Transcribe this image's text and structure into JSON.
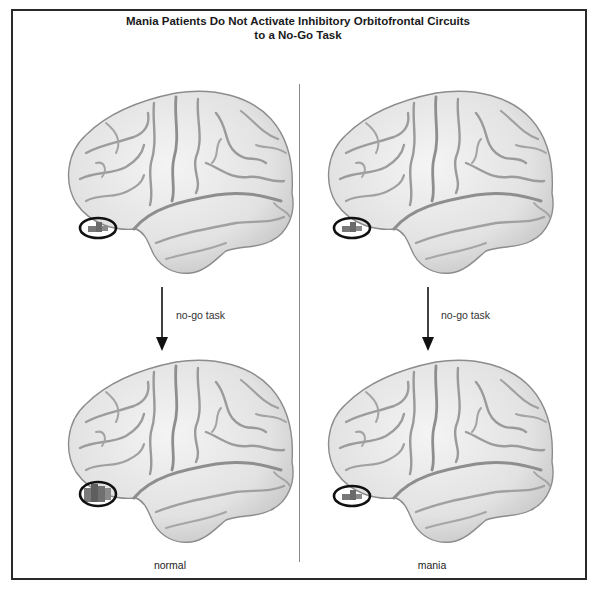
{
  "figure": {
    "title_line1": "Mania Patients Do Not Activate Inhibitory Orbitofrontal Circuits",
    "title_line2": "to a No-Go Task"
  },
  "panels": [
    {
      "id": "normal",
      "label": "normal",
      "arrow_label": "no-go task",
      "before": {
        "activation": "small",
        "highlight": "orbitofrontal"
      },
      "after": {
        "activation": "large",
        "highlight": "orbitofrontal"
      }
    },
    {
      "id": "mania",
      "label": "mania",
      "arrow_label": "no-go task",
      "before": {
        "activation": "small",
        "highlight": "orbitofrontal"
      },
      "after": {
        "activation": "small",
        "highlight": "orbitofrontal"
      }
    }
  ],
  "colors": {
    "brain_fill": "#e6e6e6",
    "brain_outline": "#8c8c8c",
    "sulci": "#9a9a9a",
    "highlight_ring": "#111111",
    "activation": "#6e6e6e",
    "divider": "#8a8a8a",
    "frame": "#2a2a2a"
  }
}
